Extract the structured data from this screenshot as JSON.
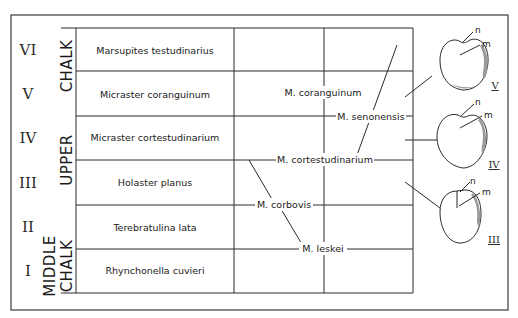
{
  "diagram": {
    "stages": [
      {
        "roman": "VI",
        "zone": "Marsupites testudinarius"
      },
      {
        "roman": "V",
        "zone": "Micraster coranguinum"
      },
      {
        "roman": "IV",
        "zone": "Micraster cortestudinarium"
      },
      {
        "roman": "III",
        "zone": "Holaster planus"
      },
      {
        "roman": "II",
        "zone": "Terebratulina lata"
      },
      {
        "roman": "I",
        "zone": "Rhynchonella cuvieri"
      }
    ],
    "formations": {
      "upper_line1": "UPPER",
      "upper_line2": "CHALK",
      "middle_line1": "MIDDLE",
      "middle_line2": "CHALK"
    },
    "species": {
      "coranguinum": "M. coranguinum",
      "senonensis": "M. senonensis",
      "cortestudinarium": "M. cortestudinarium",
      "corbovis": "M. corbovis",
      "leskei": "M. leskei"
    },
    "fossils": [
      {
        "label": "V",
        "n": "n",
        "m": "m"
      },
      {
        "label": "IV",
        "n": "n",
        "m": "m"
      },
      {
        "label": "III",
        "n": "n",
        "m": "m"
      }
    ]
  }
}
